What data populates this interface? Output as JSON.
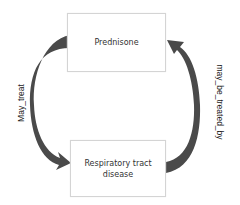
{
  "diagram": {
    "type": "relationship-cycle",
    "colors": {
      "arrow": "#4a4a4a",
      "node_border": "#d4d4d4",
      "text": "#333333"
    },
    "nodes": [
      {
        "id": "prednisone",
        "label": "Prednisone"
      },
      {
        "id": "respiratory",
        "label": "Respiratory tract disease"
      }
    ],
    "edges": [
      {
        "from": "prednisone",
        "to": "respiratory",
        "label": "May_treat",
        "side": "left"
      },
      {
        "from": "respiratory",
        "to": "prednisone",
        "label": "may_be_treated_by",
        "side": "right"
      }
    ]
  }
}
